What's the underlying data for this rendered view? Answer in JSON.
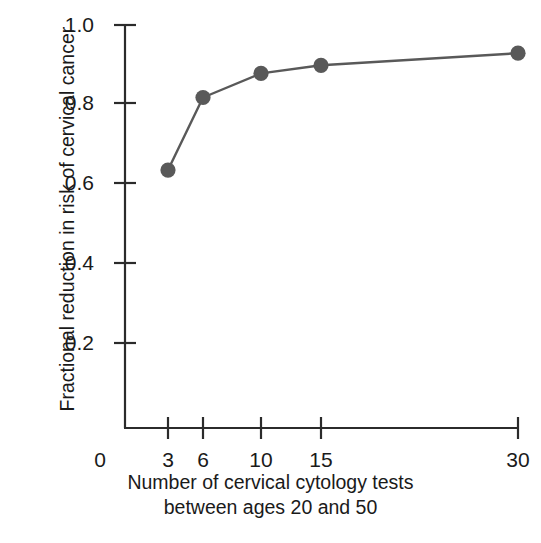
{
  "chart_data": {
    "type": "line",
    "title": "",
    "subtitle": "",
    "xlabel_lines": [
      "Number of cervical cytology tests",
      "between ages 20 and 50"
    ],
    "ylabel_lines": [
      "Fractional reduction in risk of",
      "cervical cancer"
    ],
    "x": [
      3,
      6,
      10,
      15,
      30
    ],
    "values": [
      0.64,
      0.82,
      0.88,
      0.9,
      0.93
    ],
    "series": [
      {
        "name": "Fractional reduction in risk of cervical cancer",
        "values": [
          0.64,
          0.82,
          0.88,
          0.9,
          0.93
        ]
      }
    ],
    "point_labels": [
      "0.64",
      "0.82",
      "0.88",
      "0.90",
      "0.93"
    ],
    "xtick_labels": [
      "0",
      "3",
      "6",
      "10",
      "15",
      "30"
    ],
    "xtick_values": [
      0,
      3,
      6,
      10,
      15,
      30
    ],
    "ytick_labels": [
      "0.2",
      "0.4",
      "0.6",
      "0.8",
      "1.0"
    ],
    "ytick_values": [
      0.2,
      0.4,
      0.6,
      0.8,
      1.0
    ],
    "ylim": [
      0,
      1.0
    ],
    "xlim_category_positions": [
      125,
      168,
      203,
      261,
      321,
      518
    ],
    "grid": false,
    "legend": "none",
    "marker": "filled-circle",
    "marker_color": "#595959",
    "line_color": "#595959",
    "axis_color": "#2b2b2b",
    "background_color": "#ffffff",
    "text_color": "#1a1a1a"
  },
  "axes": {
    "y_ticks": [
      {
        "label": "1.0",
        "y": 25
      },
      {
        "label": "0.8",
        "y": 103
      },
      {
        "label": "0.6",
        "y": 183
      },
      {
        "label": "0.4",
        "y": 263
      },
      {
        "label": "0.2",
        "y": 343
      }
    ],
    "x_ticks": [
      {
        "label": "0",
        "x": 100,
        "tick": false
      },
      {
        "label": "3",
        "x": 168,
        "tick": true
      },
      {
        "label": "6",
        "x": 203,
        "tick": true
      },
      {
        "label": "10",
        "x": 261,
        "tick": true
      },
      {
        "label": "15",
        "x": 321,
        "tick": true
      },
      {
        "label": "30",
        "x": 518,
        "tick": true
      }
    ]
  }
}
